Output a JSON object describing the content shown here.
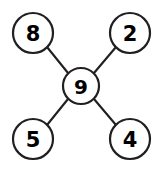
{
  "diagram": {
    "type": "node-link-star",
    "background_color": "#ffffff",
    "stroke_color": "#231f20",
    "label_color": "#000000",
    "node_fill": "#ffffff",
    "center": {
      "id": "center",
      "label": "9",
      "cx": 81,
      "cy": 86,
      "r": 18
    },
    "nodes": [
      {
        "id": "top-left",
        "label": "8",
        "cx": 33,
        "cy": 33,
        "r": 20
      },
      {
        "id": "top-right",
        "label": "2",
        "cx": 130,
        "cy": 33,
        "r": 20
      },
      {
        "id": "bottom-left",
        "label": "5",
        "cx": 33,
        "cy": 139,
        "r": 20
      },
      {
        "id": "bottom-right",
        "label": "4",
        "cx": 130,
        "cy": 139,
        "r": 20
      }
    ],
    "edges": [
      {
        "id": "edge-top-left",
        "from": "top-left",
        "to": "center",
        "x1": 47,
        "y1": 47,
        "x2": 68,
        "y2": 73
      },
      {
        "id": "edge-top-right",
        "from": "top-right",
        "to": "center",
        "x1": 116,
        "y1": 47,
        "x2": 94,
        "y2": 73
      },
      {
        "id": "edge-bottom-left",
        "from": "bottom-left",
        "to": "center",
        "x1": 47,
        "y1": 125,
        "x2": 68,
        "y2": 99
      },
      {
        "id": "edge-bottom-right",
        "from": "bottom-right",
        "to": "center",
        "x1": 116,
        "y1": 125,
        "x2": 94,
        "y2": 99
      }
    ]
  }
}
